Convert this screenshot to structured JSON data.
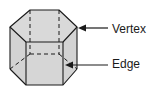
{
  "figure": {
    "fill_color": "#d3d3d3",
    "stroke_color": "#1a1a1a",
    "labels": [
      {
        "id": "vertex",
        "text": "Vertex"
      },
      {
        "id": "edge",
        "text": "Edge"
      }
    ]
  }
}
